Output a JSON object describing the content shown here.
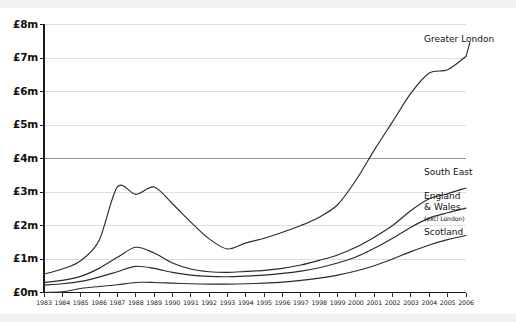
{
  "chart_data": {
    "type": "line",
    "title": "",
    "xlabel": "",
    "ylabel": "",
    "xlim": [
      1983,
      2006
    ],
    "ylim": [
      0,
      8
    ],
    "grid": true,
    "legend_position": "right-inline-labels",
    "y_tick_labels": [
      "£8m",
      "£7m",
      "£6m",
      "£5m",
      "£4m",
      "£3m",
      "£2m",
      "£1m",
      "£0m"
    ],
    "y_ticks": [
      8,
      7,
      6,
      5,
      4,
      3,
      2,
      1,
      0
    ],
    "x": [
      1983,
      1984,
      1985,
      1986,
      1987,
      1988,
      1989,
      1990,
      1991,
      1992,
      1993,
      1994,
      1995,
      1996,
      1997,
      1998,
      1999,
      2000,
      2001,
      2002,
      2003,
      2004,
      2005,
      2006
    ],
    "categories": [
      "1983",
      "1984",
      "1985",
      "1986",
      "1987",
      "1988",
      "1989",
      "1990",
      "1991",
      "1992",
      "1993",
      "1994",
      "1995",
      "1996",
      "1997",
      "1998",
      "1999",
      "2000",
      "2001",
      "2002",
      "2003",
      "2004",
      "2005",
      "2006"
    ],
    "series": [
      {
        "name": "Greater London",
        "label": "Greater London",
        "color": "#2b2b2b",
        "values": [
          0.55,
          0.7,
          0.95,
          1.55,
          3.15,
          2.93,
          3.15,
          2.65,
          2.1,
          1.6,
          1.3,
          1.48,
          1.62,
          1.8,
          2.0,
          2.25,
          2.62,
          3.35,
          4.25,
          5.1,
          5.95,
          6.55,
          6.65,
          7.05
        ]
      },
      {
        "name": "South East",
        "label": "South East",
        "color": "#2b2b2b",
        "values": [
          0.3,
          0.36,
          0.48,
          0.72,
          1.05,
          1.35,
          1.18,
          0.88,
          0.7,
          0.62,
          0.6,
          0.63,
          0.66,
          0.72,
          0.82,
          0.96,
          1.12,
          1.35,
          1.65,
          2.0,
          2.45,
          2.8,
          2.95,
          3.12
        ]
      },
      {
        "name": "England & Wales",
        "label": "England\n& Wales",
        "sublabel": "(excl London)",
        "color": "#2b2b2b",
        "values": [
          0.22,
          0.26,
          0.33,
          0.46,
          0.62,
          0.78,
          0.72,
          0.6,
          0.52,
          0.48,
          0.47,
          0.49,
          0.52,
          0.57,
          0.64,
          0.74,
          0.88,
          1.06,
          1.32,
          1.62,
          1.95,
          2.22,
          2.38,
          2.52
        ]
      },
      {
        "name": "Scotland",
        "label": "Scotland",
        "color": "#2b2b2b",
        "values": [
          0.0,
          0.02,
          0.12,
          0.18,
          0.23,
          0.3,
          0.3,
          0.28,
          0.26,
          0.25,
          0.25,
          0.26,
          0.28,
          0.31,
          0.36,
          0.43,
          0.52,
          0.64,
          0.8,
          1.0,
          1.22,
          1.42,
          1.58,
          1.7
        ]
      }
    ]
  },
  "labels": {
    "greater_london": "Greater London",
    "south_east": "South East",
    "england_line1": "England",
    "england_line2": "& Wales",
    "england_sub": "(excl London)",
    "scotland": "Scotland"
  }
}
